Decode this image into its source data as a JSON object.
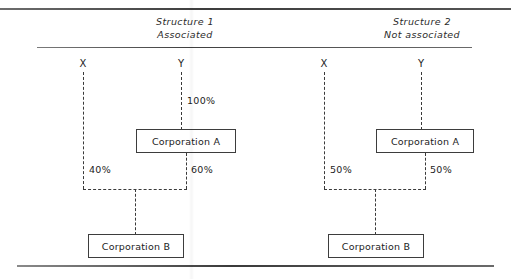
{
  "figure": {
    "panels": [
      {
        "id": "structure-1",
        "title_line1": "Structure 1",
        "title_line2": "Associated",
        "owners": [
          {
            "id": "owner-x",
            "label": "X"
          },
          {
            "id": "owner-y",
            "label": "Y"
          }
        ],
        "entities": [
          {
            "id": "corporation-a",
            "label": "Corporation A"
          },
          {
            "id": "corporation-b",
            "label": "Corporation B"
          }
        ],
        "ownership": [
          {
            "from": "Y",
            "to": "Corporation A",
            "percent": "100%"
          },
          {
            "from": "X",
            "to": "Corporation B",
            "percent": "40%"
          },
          {
            "from": "Corporation A",
            "to": "Corporation B",
            "percent": "60%"
          }
        ]
      },
      {
        "id": "structure-2",
        "title_line1": "Structure 2",
        "title_line2": "Not associated",
        "owners": [
          {
            "id": "owner-x",
            "label": "X"
          },
          {
            "id": "owner-y",
            "label": "Y"
          }
        ],
        "entities": [
          {
            "id": "corporation-a",
            "label": "Corporation A"
          },
          {
            "id": "corporation-b",
            "label": "Corporation B"
          }
        ],
        "ownership": [
          {
            "from": "X",
            "to": "Corporation B",
            "percent": "50%"
          },
          {
            "from": "Corporation A",
            "to": "Corporation B",
            "percent": "50%"
          }
        ]
      }
    ],
    "colors": {
      "rule": "#3d3d3d",
      "box_border": "#3d3d3d",
      "connector": "#3a3a3a",
      "text": "#1c1c1c",
      "background": "#ffffff"
    }
  }
}
